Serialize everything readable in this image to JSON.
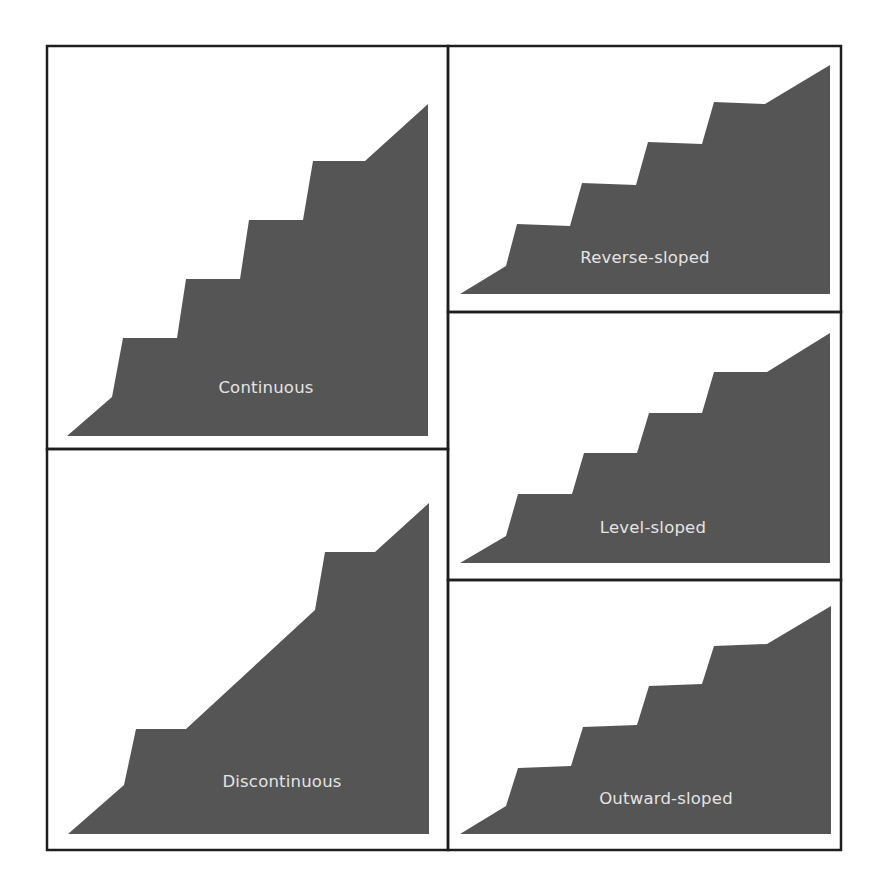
{
  "figure": {
    "colors": {
      "fill": "#555555",
      "border": "#1e1e1e",
      "label": "#e4e4e4",
      "background": "#ffffff"
    },
    "panels": [
      {
        "id": "continuous",
        "label": "Continuous",
        "box": [
          47,
          46,
          448,
          449
        ],
        "label_pos": [
          266,
          378
        ],
        "points": "67,436 112,397 123,338 177,338 186,279 240,279 249,220 303,220 313,161 365,161 428,104 428,436"
      },
      {
        "id": "discontinuous",
        "label": "Discontinuous",
        "box": [
          47,
          449,
          448,
          850
        ],
        "label_pos": [
          282,
          772
        ],
        "points": "68,834 124,785 136,729 186,729 315,610 325,552 375,552 429,503 429,834"
      },
      {
        "id": "reverse-sloped",
        "label": "Reverse-sloped",
        "box": [
          448,
          46,
          841,
          312
        ],
        "label_pos": [
          645,
          248
        ],
        "points": "460,294 506,266 517,224 570,226 582,183 636,185 648,142 702,144 714,102 765,104 830,65 830,294"
      },
      {
        "id": "level-sloped",
        "label": "Level-sloped",
        "box": [
          448,
          312,
          841,
          580
        ],
        "label_pos": [
          653,
          518
        ],
        "points": "460,563 506,536 518,494 572,494 584,453 637,453 649,413 702,413 714,372 767,372 830,333 830,563"
      },
      {
        "id": "outward-sloped",
        "label": "Outward-sloped",
        "box": [
          448,
          580,
          841,
          850
        ],
        "label_pos": [
          666,
          789
        ],
        "points": "460,834 506,806 518,768 571,766 583,727 637,725 649,686 702,684 714,646 767,644 831,606 831,834"
      }
    ]
  }
}
